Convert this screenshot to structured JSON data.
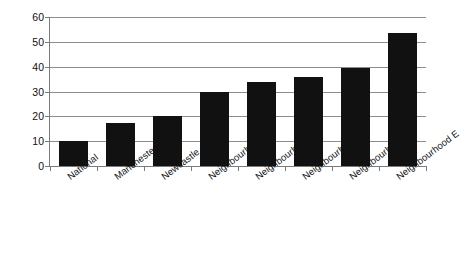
{
  "chart_data": {
    "type": "bar",
    "title": "",
    "xlabel": "",
    "ylabel": "% rate turnover of tenants",
    "categories": [
      "National",
      "Manchester",
      "Newcastle",
      "Neighbourhood A",
      "Neighbourhood B",
      "Neighbourhood C",
      "Neighbourhood D",
      "Neighbourhood E"
    ],
    "values": [
      10,
      17.5,
      20,
      30,
      34,
      36,
      39.5,
      53.5
    ],
    "ylim": [
      0,
      60
    ],
    "yticks": [
      0,
      10,
      20,
      30,
      40,
      50,
      60
    ],
    "ytick_labels": [
      "0",
      "10",
      "20",
      "30",
      "40",
      "50",
      "60"
    ],
    "grid": true,
    "legend": "none",
    "bar_color": "#111111",
    "axis_color": "#7b7b7b",
    "gridline_color": "#8c8c8c",
    "background_color": "#ffffff"
  }
}
